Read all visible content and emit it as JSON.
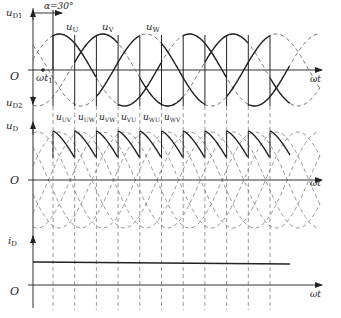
{
  "figure": {
    "top_panel": {
      "y_label_top": "u",
      "y_label_top_sub": "D1",
      "y_label_bottom": "u",
      "y_label_bottom_sub": "D2",
      "alpha_label": "α=30°",
      "origin": "O",
      "t1_label": "ωt",
      "t1_sub": "1",
      "x_label": "ωt",
      "phase_labels": [
        {
          "base": "u",
          "sub": "U"
        },
        {
          "base": "u",
          "sub": "V"
        },
        {
          "base": "u",
          "sub": "W"
        }
      ]
    },
    "middle_panel": {
      "y_label": "u",
      "y_label_sub": "D",
      "origin": "O",
      "x_label": "ωt",
      "line_voltage_labels": [
        {
          "base": "u",
          "sub": "UV"
        },
        {
          "base": "u",
          "sub": "UW"
        },
        {
          "base": "u",
          "sub": "VW"
        },
        {
          "base": "u",
          "sub": "VU"
        },
        {
          "base": "u",
          "sub": "WU"
        },
        {
          "base": "u",
          "sub": "WV"
        }
      ]
    },
    "bottom_panel": {
      "y_label": "i",
      "y_label_sub": "D",
      "origin": "O",
      "x_label": "ωt"
    }
  },
  "colors": {
    "line": "#222222",
    "dashed": "#555555",
    "axis": "#333333"
  }
}
